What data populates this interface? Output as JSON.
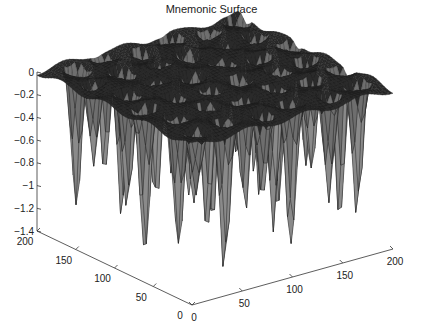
{
  "chart_data": {
    "type": "surface",
    "title": "Mnemonic Surface",
    "xlabel": "",
    "ylabel": "",
    "zlabel": "",
    "x_ticks": [
      0,
      50,
      100,
      150,
      200
    ],
    "y_ticks": [
      0,
      50,
      100,
      150,
      200
    ],
    "z_ticks": [
      0,
      -0.2,
      -0.4,
      -0.6,
      -0.8,
      -1,
      -1.2,
      -1.4
    ],
    "z_tick_labels": [
      "0",
      "−0.2",
      "−0.4",
      "−0.6",
      "−0.8",
      "−1",
      "−1.2",
      "−1.4"
    ],
    "xlim": [
      0,
      200
    ],
    "ylim": [
      0,
      200
    ],
    "zlim": [
      -1.4,
      0
    ],
    "grid": false,
    "render": "mesh",
    "surface_description": "Flat plateau near z=0 with a regular lattice of sharp downward spikes (Gaussian-like wells) reaching about -0.6 to -1.4; domed bumps visible on the top surface",
    "mesh_color": "#1a1a1a",
    "mesh_highlight": "#bdbdbd"
  }
}
